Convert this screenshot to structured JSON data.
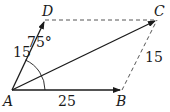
{
  "diagram": {
    "type": "vector-parallelogram",
    "points": {
      "A": {
        "label": "A",
        "x": 12,
        "y": 90
      },
      "B": {
        "label": "B",
        "x": 122,
        "y": 90
      },
      "C": {
        "label": "C",
        "x": 157,
        "y": 20
      },
      "D": {
        "label": "D",
        "x": 45,
        "y": 20
      }
    },
    "labels": {
      "AD_length": "15",
      "AB_length": "25",
      "BC_length": "15",
      "angle_DAB": "75°"
    },
    "edges": [
      {
        "from": "A",
        "to": "B",
        "style": "solid-arrow"
      },
      {
        "from": "A",
        "to": "D",
        "style": "solid-arrow"
      },
      {
        "from": "A",
        "to": "C",
        "style": "solid-arrow"
      },
      {
        "from": "D",
        "to": "C",
        "style": "dashed"
      },
      {
        "from": "B",
        "to": "C",
        "style": "dashed"
      }
    ],
    "colors": {
      "line": "#1a1a1a",
      "dashed": "#555555",
      "background": "#ffffff"
    }
  }
}
